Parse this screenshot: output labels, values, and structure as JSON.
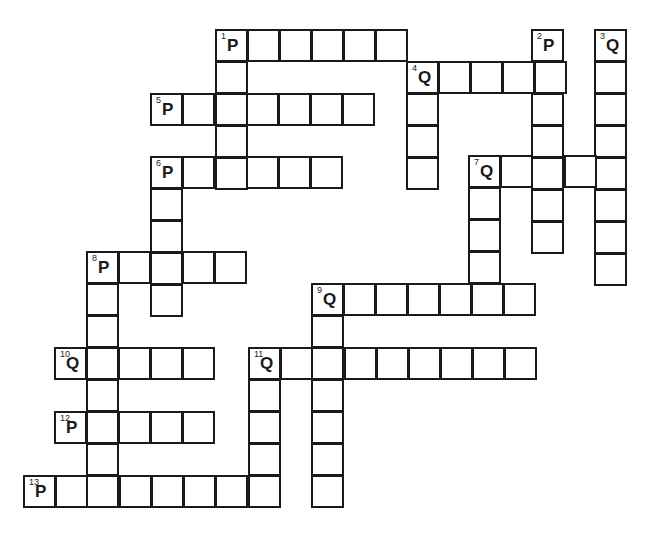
{
  "puzzle": {
    "cell_size": 33,
    "line_color": "#1a1a1a",
    "background": "#ffffff",
    "clues": [
      {
        "number": "1",
        "letter": "P",
        "direction": "across",
        "length": 6,
        "x": 215,
        "y": 29
      },
      {
        "number": "2",
        "letter": "P",
        "direction": "down",
        "length": 7,
        "x": 531,
        "y": 29
      },
      {
        "number": "3",
        "letter": "Q",
        "direction": "down",
        "length": 8,
        "x": 594,
        "y": 29
      },
      {
        "number": "4",
        "letter": "Q",
        "direction": "across",
        "length": 5,
        "x": 406,
        "y": 61
      },
      {
        "number": "5",
        "letter": "P",
        "direction": "across",
        "length": 7,
        "x": 150,
        "y": 93
      },
      {
        "number": "6",
        "letter": "P",
        "direction": "across",
        "length": 6,
        "x": 150,
        "y": 156
      },
      {
        "number": "7",
        "letter": "Q",
        "direction": "across",
        "length": 5,
        "x": 468,
        "y": 155
      },
      {
        "number": "8",
        "letter": "P",
        "direction": "across",
        "length": 5,
        "x": 86,
        "y": 251
      },
      {
        "number": "9",
        "letter": "Q",
        "direction": "across",
        "length": 7,
        "x": 311,
        "y": 283
      },
      {
        "number": "10",
        "letter": "Q",
        "direction": "across",
        "length": 5,
        "x": 54,
        "y": 347
      },
      {
        "number": "11",
        "letter": "Q",
        "direction": "across",
        "length": 9,
        "x": 248,
        "y": 347
      },
      {
        "number": "12",
        "letter": "P",
        "direction": "across",
        "length": 5,
        "x": 54,
        "y": 411
      },
      {
        "number": "13",
        "letter": "P",
        "direction": "across",
        "length": 8,
        "x": 23,
        "y": 475
      }
    ],
    "extra_runs": [
      {
        "label": "1-down",
        "direction": "down",
        "length": 5,
        "x": 215,
        "y": 29
      },
      {
        "label": "4-down",
        "direction": "down",
        "length": 4,
        "x": 406,
        "y": 61
      },
      {
        "label": "6-down",
        "direction": "down",
        "length": 5,
        "x": 150,
        "y": 156
      },
      {
        "label": "7-down",
        "direction": "down",
        "length": 5,
        "x": 468,
        "y": 155
      },
      {
        "label": "8-down",
        "direction": "down",
        "length": 8,
        "x": 86,
        "y": 251
      },
      {
        "label": "9-down",
        "direction": "down",
        "length": 7,
        "x": 311,
        "y": 283
      },
      {
        "label": "11-down",
        "direction": "down",
        "length": 5,
        "x": 248,
        "y": 347
      }
    ]
  }
}
